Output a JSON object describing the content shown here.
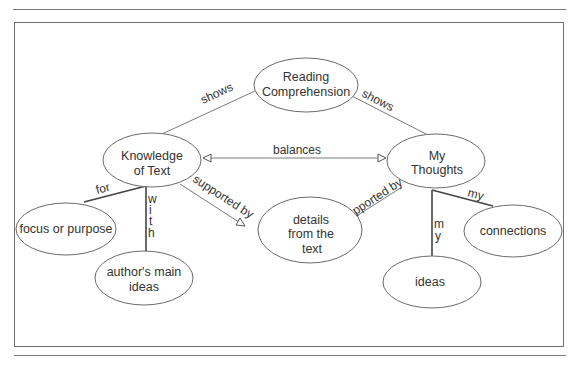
{
  "diagram": {
    "type": "concept-map",
    "nodes": [
      {
        "id": "reading",
        "lines": [
          "Reading",
          "Comprehension"
        ]
      },
      {
        "id": "knowledge",
        "lines": [
          "Knowledge",
          "of Text"
        ]
      },
      {
        "id": "thoughts",
        "lines": [
          "My",
          "Thoughts"
        ]
      },
      {
        "id": "details",
        "lines": [
          "details",
          "from the",
          "text"
        ]
      },
      {
        "id": "focus",
        "lines": [
          "focus or purpose"
        ]
      },
      {
        "id": "author",
        "lines": [
          "author's main",
          "ideas"
        ]
      },
      {
        "id": "connections",
        "lines": [
          "connections"
        ]
      },
      {
        "id": "ideas",
        "lines": [
          "ideas"
        ]
      }
    ],
    "edges": [
      {
        "from": "reading",
        "to": "knowledge",
        "label": "shows"
      },
      {
        "from": "reading",
        "to": "thoughts",
        "label": "shows"
      },
      {
        "from": "knowledge",
        "to": "thoughts",
        "label": "balances",
        "arrows": "both"
      },
      {
        "from": "knowledge",
        "to": "details",
        "label": "supported by",
        "arrows": "end"
      },
      {
        "from": "thoughts",
        "to": "details",
        "label": "supported by",
        "arrows": "end"
      },
      {
        "from": "knowledge",
        "to": "focus",
        "label": "for"
      },
      {
        "from": "knowledge",
        "to": "author",
        "label": "with",
        "vertical_chars": [
          "w",
          "i",
          "t",
          "h"
        ]
      },
      {
        "from": "thoughts",
        "to": "connections",
        "label": "my"
      },
      {
        "from": "thoughts",
        "to": "ideas",
        "label": "my",
        "vertical_chars": [
          "m",
          "y"
        ]
      }
    ]
  }
}
